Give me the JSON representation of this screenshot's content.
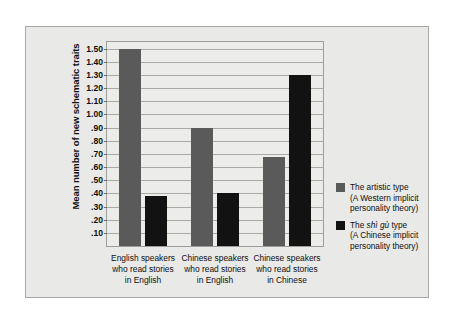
{
  "chart_data": {
    "type": "bar",
    "title": "",
    "xlabel": "",
    "ylabel": "Mean number of new schematic traits",
    "ylim": [
      0,
      1.55
    ],
    "grid": true,
    "legend_position": "right",
    "categories": [
      "English speakers\nwho read stories\nin English",
      "Chinese speakers\nwho read stories\nin English",
      "Chinese speakers\nwho read stories\nin Chinese"
    ],
    "category_lines": [
      [
        "English speakers",
        "who read stories",
        "in English"
      ],
      [
        "Chinese speakers",
        "who read stories",
        "in English"
      ],
      [
        "Chinese speakers",
        "who read stories",
        "in Chinese"
      ]
    ],
    "yticks": [
      ".10",
      ".20",
      ".30",
      ".40",
      ".50",
      ".60",
      ".70",
      ".80",
      ".90",
      "1.00",
      "1.10",
      "1.20",
      "1.30",
      "1.40",
      "1.50"
    ],
    "ytick_values": [
      0.1,
      0.2,
      0.3,
      0.4,
      0.5,
      0.6,
      0.7,
      0.8,
      0.9,
      1.0,
      1.1,
      1.2,
      1.3,
      1.4,
      1.5
    ],
    "series": [
      {
        "name": "The artistic type (A Western implicit personality theory)",
        "color": "#5a5a5a",
        "values": [
          1.5,
          0.9,
          0.68
        ]
      },
      {
        "name": "The shì gù type (A Chinese implicit personality theory)",
        "color": "#121212",
        "values": [
          0.38,
          0.4,
          1.3
        ]
      }
    ]
  },
  "legend": {
    "items": [
      {
        "color": "#5a5a5a",
        "line1": "The artistic type",
        "line2": "(A Western implicit",
        "line3": "personality theory)"
      },
      {
        "color": "#121212",
        "line1_pre": "The ",
        "line1_pinyin": "shì gù",
        "line1_post": " type",
        "line2": "(A Chinese implicit",
        "line3": "personality theory)"
      }
    ]
  },
  "colors": {
    "figure_background": "#e9e9e7",
    "plot_background": "#ececea",
    "gridline": "#a9a9a5",
    "frame_border": "#a8a8a4"
  }
}
